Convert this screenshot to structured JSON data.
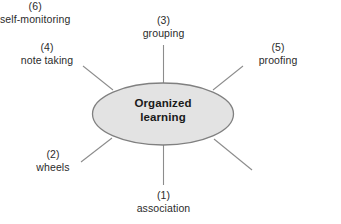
{
  "diagram": {
    "type": "spoke-hub diagram",
    "center": {
      "line1": "Organized",
      "line2": "learning",
      "fill_color": "#e3e3e3",
      "stroke_color": "#808080"
    },
    "line_color": "#8c8c8c",
    "background_color": "#ffffff",
    "nodes": [
      {
        "id": "association",
        "number": "(1)",
        "label": "association",
        "position": "bottom"
      },
      {
        "id": "wheels",
        "number": "(2)",
        "label": "wheels",
        "position": "bottom-left"
      },
      {
        "id": "grouping",
        "number": "(3)",
        "label": "grouping",
        "position": "top"
      },
      {
        "id": "note-taking",
        "number": "(4)",
        "label": "note taking",
        "position": "top-left"
      },
      {
        "id": "proofing",
        "number": "(5)",
        "label": "proofing",
        "position": "top-right"
      },
      {
        "id": "self-monitoring",
        "number": "(6)",
        "label": "self-monitoring",
        "position": "bottom-right"
      }
    ]
  }
}
